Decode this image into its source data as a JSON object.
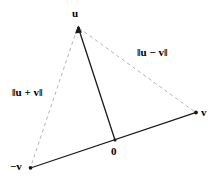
{
  "figure": {
    "kind": "vector-diagram",
    "background_color": "#ffffff",
    "solid_stroke_color": "#1a1a1a",
    "dashed_stroke_color": "#aaaaaa",
    "text_color": "#000000"
  },
  "vertices": [
    {
      "key": "u",
      "label": "u",
      "x": 78,
      "y": 27
    },
    {
      "key": "v",
      "label": "v",
      "x": 196,
      "y": 113
    },
    {
      "key": "neg_v",
      "label": "−v",
      "x": 30,
      "y": 168
    },
    {
      "key": "origin",
      "label": "0",
      "x": 115,
      "y": 140
    }
  ],
  "labels": {
    "u": "u",
    "v": "v",
    "neg_v": "−v",
    "origin": "0",
    "u_minus_v": "‖u − v‖",
    "u_plus_v": "‖u + v‖"
  },
  "segments": [
    {
      "key": "neg_v_to_v",
      "from": "neg_v",
      "to": "v",
      "style": "solid",
      "label": ""
    },
    {
      "key": "origin_to_u",
      "from": "origin",
      "to": "u",
      "style": "solid",
      "label": ""
    },
    {
      "key": "u_to_v",
      "from": "u",
      "to": "v",
      "style": "dashed",
      "label": "‖u − v‖"
    },
    {
      "key": "u_to_neg_v",
      "from": "u",
      "to": "neg_v",
      "style": "dashed",
      "label": "‖u + v‖"
    }
  ]
}
